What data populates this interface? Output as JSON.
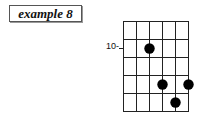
{
  "title": "example 8",
  "diagram": {
    "type": "guitar-chord-diagram",
    "strings": 6,
    "frets_shown": 5,
    "fret_label": "10-",
    "fret_label_row": 2,
    "dots": [
      {
        "string": 3,
        "fret_row": 2
      },
      {
        "string": 4,
        "fret_row": 4
      },
      {
        "string": 6,
        "fret_row": 4
      },
      {
        "string": 5,
        "fret_row": 5
      }
    ],
    "colors": {
      "grid": "#222222",
      "dot": "#000000",
      "background": "#ffffff"
    }
  }
}
